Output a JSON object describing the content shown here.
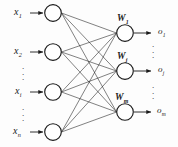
{
  "figure": {
    "background_color": "#fdfdfd",
    "stroke_color": "#1a1a1a",
    "node_fill": "#ffffff"
  },
  "input_layer": {
    "name": "input-layer",
    "node_count_shown": 4,
    "nodes": [
      {
        "id": "x1",
        "label": "x",
        "subscript": "1",
        "cx": 53,
        "cy": 13,
        "r": 8.5
      },
      {
        "id": "x2",
        "label": "x",
        "subscript": "2",
        "cx": 53,
        "cy": 52,
        "r": 8.5
      },
      {
        "id": "xi",
        "label": "x",
        "subscript": "i",
        "cx": 53,
        "cy": 92,
        "r": 8.5
      },
      {
        "id": "xn",
        "label": "x",
        "subscript": "n",
        "cx": 53,
        "cy": 132,
        "r": 8.5
      }
    ],
    "ellipses": [
      {
        "id": "input-ellipsis-1",
        "x": 22,
        "y": 66
      },
      {
        "id": "input-ellipsis-2",
        "x": 22,
        "y": 108
      }
    ]
  },
  "output_layer": {
    "name": "output-layer",
    "node_count_shown": 3,
    "nodes": [
      {
        "id": "o1",
        "weight_label": "W",
        "weight_subscript": "1",
        "output_label": "o",
        "output_subscript": "1",
        "cx": 125,
        "cy": 33,
        "r": 8.5
      },
      {
        "id": "oj",
        "weight_label": "W",
        "weight_subscript": "j",
        "output_label": "o",
        "output_subscript": "j",
        "cx": 125,
        "cy": 71,
        "r": 8.5
      },
      {
        "id": "om",
        "weight_label": "W",
        "weight_subscript": "m",
        "output_label": "o",
        "output_subscript": "m",
        "cx": 125,
        "cy": 112,
        "r": 8.5
      }
    ],
    "ellipses": [
      {
        "id": "output-ellipsis-1",
        "x": 152,
        "y": 44
      },
      {
        "id": "output-ellipsis-2",
        "x": 152,
        "y": 86
      }
    ]
  },
  "connections": {
    "name": "fully-connected-edges",
    "description": "every input node connects to every output node",
    "count": 12
  },
  "arrows": {
    "input_arrow_start_x": 30,
    "input_arrow_end_x": 44,
    "output_arrow_start_x": 134,
    "output_arrow_end_x": 152
  },
  "ellipsis_glyph": "."
}
